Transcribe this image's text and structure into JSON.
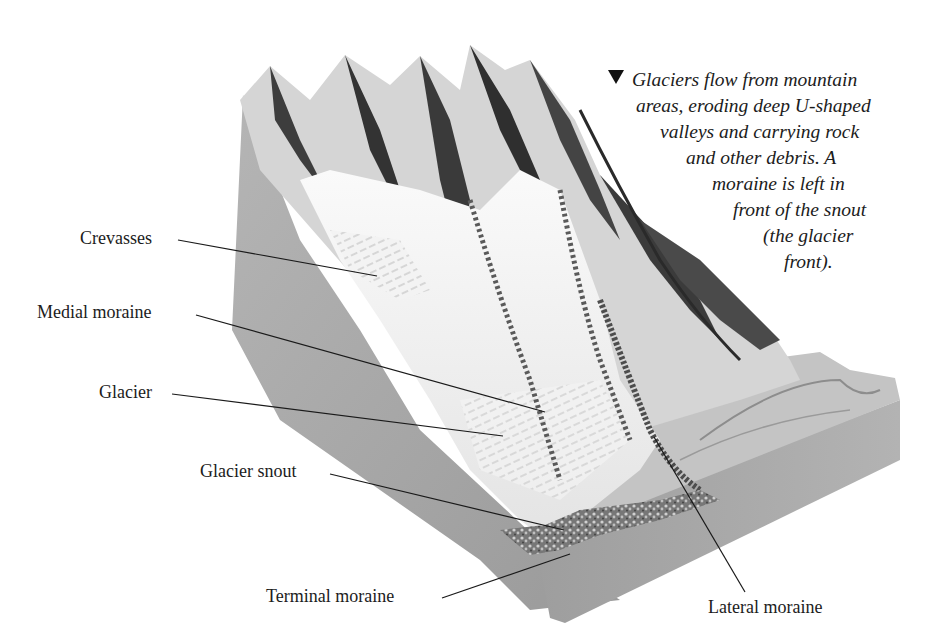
{
  "figure": {
    "caption": {
      "marker_icon": "triangle-down-icon",
      "lines": [
        "Glaciers flow from mountain",
        "areas, eroding deep U-shaped",
        "valleys and carrying rock",
        "and other debris. A",
        "moraine is left in",
        "front of the snout",
        "(the glacier",
        "front)."
      ]
    },
    "labels": [
      {
        "id": "crevasses",
        "text": "Crevasses"
      },
      {
        "id": "medial-moraine",
        "text": "Medial moraine"
      },
      {
        "id": "glacier",
        "text": "Glacier"
      },
      {
        "id": "glacier-snout",
        "text": "Glacier snout"
      },
      {
        "id": "terminal-moraine",
        "text": "Terminal moraine"
      },
      {
        "id": "lateral-moraine",
        "text": "Lateral moraine"
      }
    ],
    "colors": {
      "background": "#ffffff",
      "rock_side": "#a9a9a9",
      "rock_side_dark": "#8f8f8f",
      "mountain_dark": "#3a3a3a",
      "ice": "#f2f2f2",
      "leader_line": "#1a1a1a"
    }
  }
}
